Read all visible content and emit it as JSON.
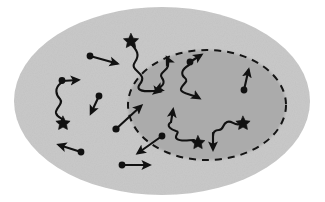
{
  "figure": {
    "canvas": {
      "width": 325,
      "height": 202,
      "background": "#ffffff"
    },
    "regions": [
      {
        "name": "outer-region",
        "shape": "ellipse",
        "cx": 162,
        "cy": 101,
        "rx": 148,
        "ry": 94,
        "fill": "#c9c9c9",
        "stroke": "none",
        "stroke_style": "none",
        "label": ""
      },
      {
        "name": "inner-region",
        "shape": "ellipse",
        "cx": 207,
        "cy": 105,
        "rx": 79,
        "ry": 55,
        "fill": "#ababab",
        "stroke": "#141414",
        "stroke_style": "dashed",
        "stroke_width": 2,
        "dash_pattern": "7 6",
        "label": ""
      }
    ],
    "glyph_colors": {
      "ink": "#111111",
      "outer_fill": "#c9c9c9",
      "inner_fill": "#ababab",
      "background": "#ffffff"
    },
    "legend_note": "",
    "particles": [
      {
        "id": "p01",
        "kind": "straight-arrow",
        "description": "dot with straight arrow pointing right and slightly down",
        "dot": [
          90,
          56
        ],
        "path": [
          [
            90,
            56
          ],
          [
            120,
            64
          ]
        ],
        "head": "arrow",
        "tail": "dot"
      },
      {
        "id": "p02",
        "kind": "wavy-arrow",
        "description": "dot with short arrow right, wavy tail descending to a star",
        "dot": [
          62,
          81
        ],
        "path": [
          [
            62,
            81
          ],
          [
            80,
            80
          ]
        ],
        "head": "arrow",
        "tail": "dot",
        "wave": [
          [
            60,
            83
          ],
          [
            55,
            92
          ],
          [
            60,
            101
          ],
          [
            56,
            110
          ],
          [
            62,
            119
          ]
        ],
        "end_marker": "star",
        "star": [
          63,
          122
        ]
      },
      {
        "id": "p03",
        "kind": "straight-arrow",
        "description": "dot with straight arrow pointing down-left",
        "dot": [
          99,
          96
        ],
        "path": [
          [
            99,
            96
          ],
          [
            90,
            115
          ]
        ],
        "head": "arrow",
        "tail": "dot"
      },
      {
        "id": "p04",
        "kind": "wavy-long",
        "description": "star at top with long wavy path crossing the inner boundary ending in an arrow pointing right",
        "star": [
          131,
          39
        ],
        "wave": [
          [
            131,
            43
          ],
          [
            140,
            53
          ],
          [
            134,
            64
          ],
          [
            144,
            74
          ],
          [
            139,
            85
          ],
          [
            150,
            90
          ],
          [
            163,
            92
          ]
        ],
        "head": "arrow",
        "end_marker": "arrow"
      },
      {
        "id": "p05",
        "kind": "straight-arrow",
        "description": "long straight arrow from a dot pointing up-right across the inner boundary",
        "dot": [
          116,
          129
        ],
        "path": [
          [
            116,
            129
          ],
          [
            143,
            104
          ]
        ],
        "head": "arrow",
        "tail": "dot"
      },
      {
        "id": "p06",
        "kind": "straight-arrow",
        "description": "straight arrow pointing down-left from a dot near the inner boundary",
        "dot": [
          162,
          136
        ],
        "path": [
          [
            162,
            136
          ],
          [
            135,
            155
          ]
        ],
        "head": "arrow",
        "tail": "dot"
      },
      {
        "id": "p07",
        "kind": "straight-arrow",
        "description": "straight arrow pointing left from a dot, lower-left region",
        "dot": [
          81,
          152
        ],
        "path": [
          [
            81,
            152
          ],
          [
            56,
            144
          ]
        ],
        "head": "arrow",
        "tail": "dot"
      },
      {
        "id": "p08",
        "kind": "straight-arrow",
        "description": "horizontal straight arrow pointing right, bottom region",
        "dot": [
          122,
          165
        ],
        "path": [
          [
            122,
            165
          ],
          [
            152,
            165
          ]
        ],
        "head": "arrow",
        "tail": "dot"
      },
      {
        "id": "p09",
        "kind": "wavy-double-arrow",
        "description": "wavy path inside inner region with an arrow at each end, upper left of inner ellipse",
        "wave": [
          [
            157,
            89
          ],
          [
            166,
            83
          ],
          [
            160,
            74
          ],
          [
            170,
            67
          ],
          [
            165,
            59
          ]
        ],
        "head": "arrow-both",
        "arrow_start": [
          153,
          91
        ],
        "arrow_end": [
          170,
          55
        ]
      },
      {
        "id": "p10",
        "kind": "wavy-arrow",
        "description": "dot with wavy path inside inner region, arrow up-right at top and arrow down-right at bottom",
        "dot": [
          190,
          62
        ],
        "wave": [
          [
            190,
            65
          ],
          [
            181,
            72
          ],
          [
            189,
            80
          ],
          [
            180,
            88
          ],
          [
            190,
            95
          ]
        ],
        "head": "arrow",
        "arrow_start": [
          203,
          53
        ],
        "arrow_end": [
          205,
          101
        ]
      },
      {
        "id": "p11",
        "kind": "straight-arrow",
        "description": "dot with straight arrow pointing up, right side of inner ellipse",
        "dot": [
          244,
          90
        ],
        "path": [
          [
            244,
            90
          ],
          [
            249,
            68
          ]
        ],
        "head": "arrow",
        "tail": "dot"
      },
      {
        "id": "p12",
        "kind": "wavy-arrow-star",
        "description": "arrow pointing up from a wavy path that ends at a star, lower middle of inner ellipse",
        "arrow_start": [
          172,
          112
        ],
        "wave": [
          [
            171,
            118
          ],
          [
            180,
            124
          ],
          [
            172,
            131
          ],
          [
            183,
            136
          ],
          [
            196,
            139
          ]
        ],
        "head": "arrow",
        "end_marker": "star",
        "star": [
          198,
          141
        ]
      },
      {
        "id": "p13",
        "kind": "wavy-arrow-star",
        "description": "star at right with wavy path ending in a downward arrow, lower right of inner ellipse",
        "star": [
          243,
          122
        ],
        "wave": [
          [
            240,
            124
          ],
          [
            230,
            122
          ],
          [
            224,
            130
          ],
          [
            215,
            128
          ],
          [
            213,
            136
          ]
        ],
        "head": "arrow",
        "arrow_end": [
          213,
          150
        ]
      }
    ],
    "counts": {
      "dots": 9,
      "stars": 5,
      "straight_arrows": 6,
      "wavy_paths": 6
    }
  }
}
